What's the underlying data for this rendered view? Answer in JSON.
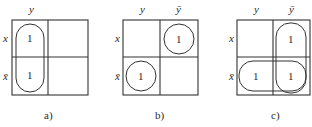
{
  "figure": {
    "diagrams": [
      {
        "id": "a",
        "caption": "a)",
        "col_labels": [
          "y",
          ""
        ],
        "row_labels": [
          "x",
          "x̄"
        ],
        "cells": [
          [
            "1",
            ""
          ],
          [
            "1",
            ""
          ]
        ],
        "groupings": [
          "vertical loop over column y (rows x and x̄)"
        ]
      },
      {
        "id": "b",
        "caption": "b)",
        "col_labels": [
          "y",
          "ȳ"
        ],
        "row_labels": [
          "x",
          "x̄"
        ],
        "cells": [
          [
            "",
            "1"
          ],
          [
            "1",
            ""
          ]
        ],
        "groupings": [
          "circle at (x, ȳ)",
          "circle at (x̄, y)"
        ]
      },
      {
        "id": "c",
        "caption": "c)",
        "col_labels": [
          "y",
          "ȳ"
        ],
        "row_labels": [
          "x",
          "x̄"
        ],
        "cells": [
          [
            "",
            "1"
          ],
          [
            "1",
            "1"
          ]
        ],
        "groupings": [
          "vertical loop over column ȳ (rows x and x̄)",
          "horizontal loop over row x̄ (columns y and ȳ)"
        ]
      }
    ]
  }
}
